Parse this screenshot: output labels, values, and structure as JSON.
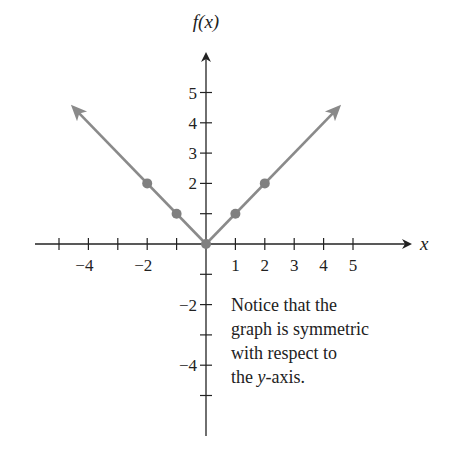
{
  "chart_data": {
    "type": "line",
    "title": "",
    "xlabel": "x",
    "ylabel": "f(x)",
    "xlim": [
      -6,
      6.5
    ],
    "ylim": [
      -6.5,
      6.5
    ],
    "grid": false,
    "legend": null,
    "x_ticks": [
      -5,
      -4,
      -3,
      -2,
      -1,
      1,
      2,
      3,
      4,
      5
    ],
    "x_tick_labels": [
      {
        "value": -4,
        "label": "−4"
      },
      {
        "value": -2,
        "label": "−2"
      },
      {
        "value": 1,
        "label": "1"
      },
      {
        "value": 2,
        "label": "2"
      },
      {
        "value": 3,
        "label": "3"
      },
      {
        "value": 4,
        "label": "4"
      },
      {
        "value": 5,
        "label": "5"
      }
    ],
    "y_ticks": [
      -5,
      -4,
      -3,
      -2,
      -1,
      1,
      2,
      3,
      4,
      5
    ],
    "y_tick_labels": [
      {
        "value": 5,
        "label": "5"
      },
      {
        "value": 4,
        "label": "4"
      },
      {
        "value": 3,
        "label": "3"
      },
      {
        "value": 2,
        "label": "2"
      },
      {
        "value": -2,
        "label": "−2"
      },
      {
        "value": -4,
        "label": "−4"
      }
    ],
    "series": [
      {
        "name": "f(x) = |x|",
        "color": "#8a8a8a",
        "line": {
          "x": [
            -4.5,
            0,
            4.5
          ],
          "y": [
            4.5,
            0,
            4.5
          ],
          "arrows_both_ends": true
        },
        "points": {
          "x": [
            -2,
            -1,
            0,
            1,
            2
          ],
          "y": [
            2,
            1,
            0,
            1,
            2
          ]
        }
      }
    ],
    "annotations": [
      {
        "text_lines": [
          "Notice that the",
          "graph is symmetric",
          "with respect to",
          "the y-axis."
        ],
        "position": {
          "x": 0.85,
          "y": -2
        }
      }
    ]
  },
  "colors": {
    "axis": "#222222",
    "graph": "#8a8a8a",
    "point": "#808080"
  }
}
